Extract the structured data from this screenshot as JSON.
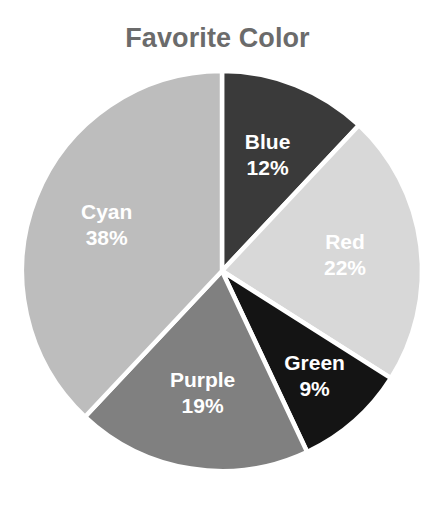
{
  "chart_data": {
    "type": "pie",
    "title": "Favorite Color",
    "xlabel": "",
    "ylabel": "",
    "legend": "none",
    "grid": false,
    "labels_inside_slices": true,
    "start_angle_deg": 0,
    "direction": "clockwise",
    "categories": [
      "Blue",
      "Red",
      "Green",
      "Purple",
      "Cyan"
    ],
    "values": [
      12,
      22,
      9,
      19,
      38
    ],
    "value_unit": "percent",
    "slices": [
      {
        "label": "Blue",
        "value": 12,
        "pct_text": "12%",
        "color": "#3a3a3a",
        "label_color": "#ffffff"
      },
      {
        "label": "Red",
        "value": 22,
        "pct_text": "22%",
        "color": "#d8d8d8",
        "label_color": "#ffffff"
      },
      {
        "label": "Green",
        "value": 9,
        "pct_text": "9%",
        "color": "#141414",
        "label_color": "#ffffff"
      },
      {
        "label": "Purple",
        "value": 19,
        "pct_text": "19%",
        "color": "#808080",
        "label_color": "#ffffff"
      },
      {
        "label": "Cyan",
        "value": 38,
        "pct_text": "38%",
        "color": "#bdbdbd",
        "label_color": "#ffffff"
      }
    ]
  },
  "style": {
    "title_color": "#6b6b6b",
    "background": "#ffffff",
    "separator_color": "#ffffff"
  },
  "geometry": {
    "center_x": 222,
    "center_y": 271,
    "radius": 200
  }
}
